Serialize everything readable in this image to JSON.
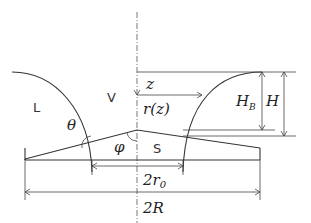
{
  "diagram": {
    "title": "",
    "labels": {
      "liquid": "L",
      "vapor": "V",
      "solid": "S",
      "theta": "θ",
      "phi": "φ",
      "z": "z",
      "r_of_z": "r(z)",
      "H_B_main": "H",
      "H_B_sub": "B",
      "H": "H",
      "two_r0_prefix": "2r",
      "two_r0_sub": "0",
      "two_R": "2R"
    },
    "colors": {
      "line": "#333333",
      "background": "#ffffff"
    }
  }
}
